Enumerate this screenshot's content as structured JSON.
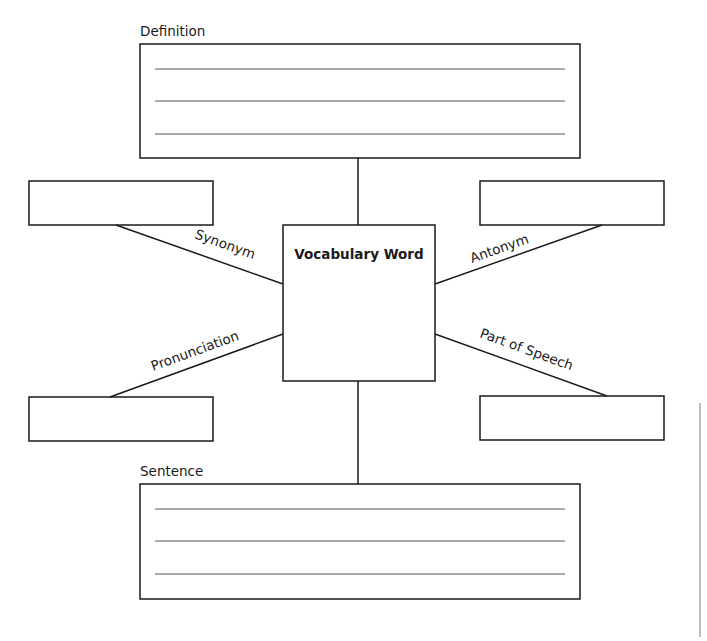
{
  "organizer": {
    "center": {
      "label": "Vocabulary Word"
    },
    "definition": {
      "label": "Definition",
      "lines": 3
    },
    "sentence": {
      "label": "Sentence",
      "lines": 3
    },
    "branches": {
      "synonym": {
        "label": "Synonym"
      },
      "antonym": {
        "label": "Antonym"
      },
      "pronunciation": {
        "label": "Pronunciation"
      },
      "part_of_speech": {
        "label": "Part of Speech"
      }
    }
  },
  "colors": {
    "stroke": "#1a1a1a",
    "rule": "#555555",
    "background": "#ffffff"
  }
}
